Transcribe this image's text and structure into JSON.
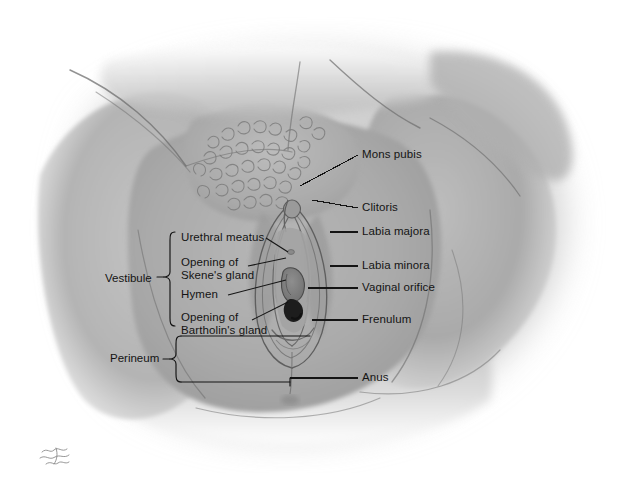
{
  "figure": {
    "medium": "graphite pencil drawing",
    "signature": "artist-signature-illegible",
    "background_color": "#ffffff",
    "body_tone_color": "#a8a8a8",
    "body_tone_light": "#c9c9c9",
    "body_tone_dark": "#7d7d7d",
    "line_color": "#141414"
  },
  "labels_right": [
    {
      "id": "mons-pubis",
      "text": "Mons pubis"
    },
    {
      "id": "clitoris",
      "text": "Clitoris"
    },
    {
      "id": "labia-majora",
      "text": "Labia majora"
    },
    {
      "id": "labia-minora",
      "text": "Labia minora"
    },
    {
      "id": "vaginal-orifice",
      "text": "Vaginal orifice"
    },
    {
      "id": "frenulum",
      "text": "Frenulum"
    },
    {
      "id": "anus",
      "text": "Anus"
    }
  ],
  "labels_left": [
    {
      "id": "urethral-meatus",
      "line1": "Urethral meatus",
      "line2": ""
    },
    {
      "id": "skene-gland",
      "line1": "Opening of",
      "line2": "Skene's gland"
    },
    {
      "id": "hymen",
      "line1": "Hymen",
      "line2": ""
    },
    {
      "id": "bartholin-gland",
      "line1": "Opening of",
      "line2": "Bartholin's gland"
    }
  ],
  "group_labels": [
    {
      "id": "vestibule",
      "text": "Vestibule"
    },
    {
      "id": "perineum",
      "text": "Perineum"
    }
  ]
}
